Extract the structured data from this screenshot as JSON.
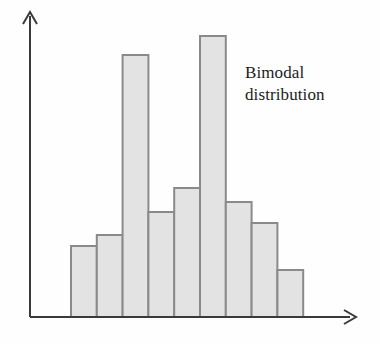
{
  "figure": {
    "background_color": "#fefefe",
    "width": 380,
    "height": 344
  },
  "annotation": {
    "label": "Bimodal\ndistribution",
    "line1": "Bimodal",
    "line2": "distribution",
    "color": "#1b1b1b"
  },
  "axes": {
    "x_axis_name": "x-axis-arrow",
    "y_axis_name": "y-axis-arrow",
    "axis_color": "#3a3a3a",
    "x_label": "",
    "y_label": "",
    "origin_x": 30,
    "origin_y": 317,
    "x_end": 355,
    "y_end": 12
  },
  "chart_data": {
    "type": "bar",
    "title": "",
    "subtitle": "",
    "xlabel": "",
    "ylabel": "",
    "categories": [
      "1",
      "2",
      "3",
      "4",
      "5",
      "6",
      "7",
      "8",
      "9"
    ],
    "values": [
      71,
      82,
      262,
      105,
      129,
      281,
      115,
      94,
      47
    ],
    "bar_tops_px": [
      246,
      235,
      55,
      212,
      188,
      36,
      202,
      223,
      270
    ],
    "baseline_px": 317,
    "bar_left_px": 71,
    "bar_width_px": 25.8,
    "ylim": [
      0,
      305
    ],
    "xlim": [
      0,
      9
    ],
    "grid": false,
    "legend": null,
    "annotations": [
      {
        "text": "Bimodal distribution",
        "x_px": 245,
        "y_px": 62
      }
    ],
    "bar_fill_color": "#e3e3e3",
    "bar_edge_color": "#8a8a8a",
    "tick_labels_x": [],
    "tick_labels_y": []
  }
}
